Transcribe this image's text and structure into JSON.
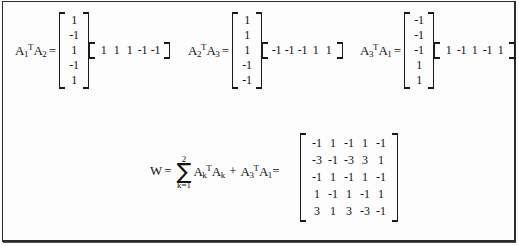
{
  "figure": {
    "type": "math-expression-figure",
    "top_row": [
      {
        "id": "expr-1",
        "label": {
          "text": "A1TA2",
          "a_main": "A",
          "a_main_sub": "1",
          "transpose": "T",
          "a_second": "A",
          "a_second_sub": "2"
        },
        "equals": "=",
        "column_vector": [
          "1",
          "-1",
          "1",
          "-1",
          "1"
        ],
        "row_vector": [
          "1",
          "1",
          "1",
          "-1",
          "-1"
        ]
      },
      {
        "id": "expr-2",
        "label": {
          "text": "A2TA3",
          "a_main": "A",
          "a_main_sub": "2",
          "transpose": "T",
          "a_second": "A",
          "a_second_sub": "3"
        },
        "equals": "=",
        "column_vector": [
          "1",
          "1",
          "1",
          "-1",
          "-1"
        ],
        "row_vector": [
          "-1",
          "-1",
          "-1",
          "1",
          "1"
        ]
      },
      {
        "id": "expr-3",
        "label": {
          "text": "A3TA1",
          "a_main": "A",
          "a_main_sub": "3",
          "transpose": "T",
          "a_second": "A",
          "a_second_sub": "1"
        },
        "equals": "=",
        "column_vector": [
          "-1",
          "-1",
          "-1",
          "1",
          "1"
        ],
        "row_vector": [
          "1",
          "-1",
          "1",
          "-1",
          "1"
        ]
      }
    ],
    "bottom_equation": {
      "lhs": "W",
      "equals": "=",
      "summation": {
        "upper_limit": "2",
        "sigma": "∑",
        "lower_limit": "k=1",
        "summand": {
          "a": "A",
          "a_sub": "k",
          "transpose": "T",
          "a2": "A",
          "a2_sub": "k"
        }
      },
      "plus": "+",
      "extra_term": {
        "a": "A",
        "a_sub": "3",
        "transpose": "T",
        "a2": "A",
        "a2_sub": "1"
      },
      "equals2": "=",
      "result_matrix": [
        [
          "-1",
          "1",
          "-1",
          "1",
          "-1"
        ],
        [
          "-3",
          "-1",
          "-3",
          "3",
          "1"
        ],
        [
          "-1",
          "1",
          "-1",
          "1",
          "-1"
        ],
        [
          "1",
          "-1",
          "1",
          "-1",
          "1"
        ],
        [
          "3",
          "1",
          "3",
          "-3",
          "-1"
        ]
      ]
    }
  }
}
